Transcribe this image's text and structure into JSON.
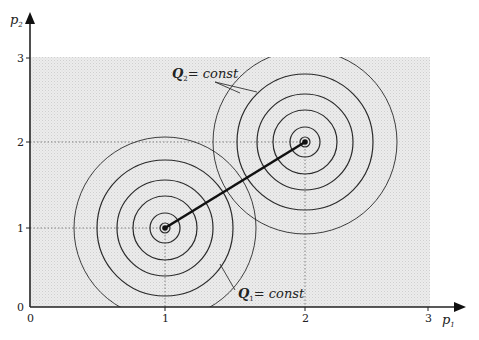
{
  "diagram": {
    "type": "iso-contour plot",
    "x_axis": {
      "label": "p",
      "label_sub": "1",
      "ticks": [
        "0",
        "1",
        "2",
        "3"
      ]
    },
    "y_axis": {
      "label": "p",
      "label_sub": "2",
      "ticks": [
        "0",
        "1",
        "2",
        "3"
      ]
    },
    "annotations": [
      {
        "id": "q2",
        "text_main": "Q",
        "text_sub": "2",
        "text_rest": "= const"
      },
      {
        "id": "q1",
        "text_main": "Q",
        "text_sub": "1",
        "text_rest": "= const"
      }
    ],
    "centers": [
      {
        "name": "Q1 center",
        "p1": 1,
        "p2": 1
      },
      {
        "name": "Q2 center",
        "p1": 2,
        "p2": 2
      }
    ],
    "ring_count_per_center": 6,
    "colors": {
      "shade": "#e6e6e6",
      "line": "#222222",
      "guide": "#555555"
    }
  }
}
